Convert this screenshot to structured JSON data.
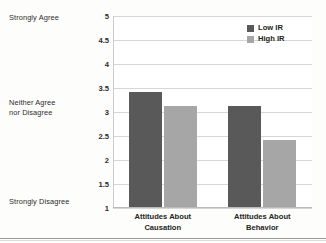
{
  "chart_data": {
    "type": "bar",
    "title": "",
    "xlabel": "",
    "ylabel": "",
    "categories": [
      "Attitudes About\nCausation",
      "Attitudes About\nBehavior"
    ],
    "series": [
      {
        "name": "Low IR",
        "color": "#595959",
        "values": [
          3.4,
          3.1
        ]
      },
      {
        "name": "High IR",
        "color": "#a6a6a6",
        "values": [
          3.1,
          2.4
        ]
      }
    ],
    "ylim": [
      1,
      5
    ],
    "yticks": [
      "1",
      "1.5",
      "2",
      "2.5",
      "3",
      "3.5",
      "4",
      "4.5",
      "5"
    ],
    "ytick_values": [
      1,
      1.5,
      2,
      2.5,
      3,
      3.5,
      4,
      4.5,
      5
    ],
    "grid": true,
    "legend_position": "top-right",
    "scale_anchors": [
      {
        "label": "Strongly Agree",
        "value": 5
      },
      {
        "label": "Neither Agree\nnor Disagree",
        "value": 3
      },
      {
        "label": "Strongly Disagree",
        "value": 1
      }
    ]
  },
  "anchors": {
    "top": "Strongly Agree",
    "middle": "Neither Agree\nnor Disagree",
    "bottom": "Strongly Disagree"
  },
  "legend": {
    "items": [
      {
        "label": "Low IR"
      },
      {
        "label": "High IR"
      }
    ]
  }
}
